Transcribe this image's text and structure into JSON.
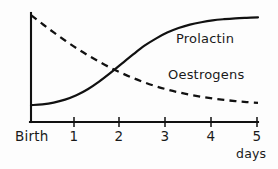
{
  "chart_data": {
    "type": "line",
    "title": "",
    "subtitle": "",
    "xlabel": "days",
    "ylabel": "",
    "grid": false,
    "legend_position": "inline-annotations",
    "xlim": [
      0,
      5
    ],
    "ylim": [
      0,
      1
    ],
    "x_tick_labels": [
      "Birth",
      "1",
      "2",
      "3",
      "4",
      "5"
    ],
    "x_tick_values": [
      0,
      1,
      2,
      3,
      4,
      5
    ],
    "y_tick_labels": [],
    "annotations": [
      {
        "text": "Prolactin",
        "x": 3.2,
        "y": 0.78
      },
      {
        "text": "Oestrogens",
        "x": 3.0,
        "y": 0.47
      }
    ],
    "series": [
      {
        "name": "Prolactin",
        "style": "solid",
        "color": "#111111",
        "x": [
          0,
          0.25,
          0.5,
          0.75,
          1.0,
          1.25,
          1.5,
          1.75,
          2.0,
          2.25,
          2.5,
          2.75,
          3.0,
          3.25,
          3.5,
          3.75,
          4.0,
          4.25,
          4.5,
          4.75,
          5.0
        ],
        "y": [
          0.155,
          0.162,
          0.178,
          0.205,
          0.245,
          0.3,
          0.37,
          0.45,
          0.535,
          0.62,
          0.7,
          0.765,
          0.82,
          0.862,
          0.893,
          0.915,
          0.932,
          0.943,
          0.951,
          0.956,
          0.96
        ]
      },
      {
        "name": "Oestrogens",
        "style": "dashed",
        "color": "#111111",
        "x": [
          0,
          0.25,
          0.5,
          0.75,
          1.0,
          1.25,
          1.5,
          1.75,
          2.0,
          2.25,
          2.5,
          2.75,
          3.0,
          3.25,
          3.5,
          3.75,
          4.0,
          4.25,
          4.5,
          4.75,
          5.0
        ],
        "y": [
          0.98,
          0.9,
          0.822,
          0.748,
          0.678,
          0.613,
          0.553,
          0.498,
          0.448,
          0.403,
          0.363,
          0.328,
          0.298,
          0.272,
          0.25,
          0.232,
          0.216,
          0.203,
          0.192,
          0.183,
          0.176
        ]
      }
    ]
  },
  "axes": {
    "x_axis_name": "time-axis",
    "y_axis_name": "level-axis",
    "origin_label": "Birth"
  },
  "labels": {
    "birth": "Birth",
    "tick_1": "1",
    "tick_2": "2",
    "tick_3": "3",
    "tick_4": "4",
    "tick_5": "5",
    "days": "days",
    "prolactin": "Prolactin",
    "oestrogens": "Oestrogens"
  },
  "colors": {
    "background": "#fdfdfd",
    "ink": "#111111"
  }
}
